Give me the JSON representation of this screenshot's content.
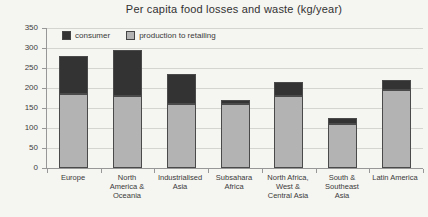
{
  "chart_data": {
    "type": "bar",
    "stacked": true,
    "title": "Per capita food losses and waste (kg/year)",
    "categories": [
      "Europe",
      "North\nAmerica &\nOceania",
      "Industrialised\nAsia",
      "Subsahara\nAfrica",
      "North Africa,\nWest &\nCentral Asia",
      "South &\nSoutheast\nAsia",
      "Latin America"
    ],
    "series": [
      {
        "name": "consumer",
        "color": "#333333",
        "values": [
          95,
          115,
          75,
          10,
          35,
          15,
          25
        ]
      },
      {
        "name": "production to retailing",
        "color": "#b3b3b3",
        "values": [
          185,
          180,
          160,
          160,
          180,
          110,
          195
        ]
      }
    ],
    "totals": [
      280,
      295,
      235,
      170,
      215,
      125,
      220
    ],
    "ylabel": "",
    "xlabel": "",
    "ylim": [
      0,
      350
    ],
    "ytick_step": 50,
    "grid": true,
    "legend_position": "top-left-inside"
  }
}
